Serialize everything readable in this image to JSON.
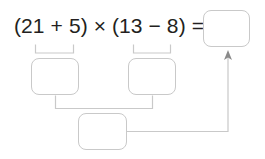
{
  "worksheet": {
    "expression": {
      "full_text": "(21 + 5) × (13 − 8) =",
      "left_paren_open": "(",
      "operand_a": "21",
      "operator_inner_left": "+",
      "operand_b": "5",
      "left_paren_close": ")",
      "operator_main": "×",
      "right_paren_open": "(",
      "operand_c": "13",
      "operator_inner_right": "−",
      "operand_d": "8",
      "right_paren_close": ")",
      "equals": "="
    },
    "answer_boxes": [
      {
        "id": "result",
        "label": "result-answer-box",
        "value": ""
      },
      {
        "id": "left",
        "label": "left-group-answer-box",
        "value": ""
      },
      {
        "id": "right",
        "label": "right-group-answer-box",
        "value": ""
      },
      {
        "id": "product",
        "label": "product-answer-box",
        "value": ""
      }
    ],
    "colors": {
      "text": "#231f20",
      "box_stroke": "#c9c9c9",
      "connector_stroke": "#c9c9c9",
      "background": "#ffffff"
    }
  }
}
